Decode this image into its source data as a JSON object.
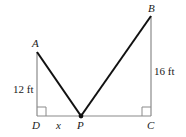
{
  "diagram": {
    "points": {
      "A": {
        "label": "A",
        "x": 37,
        "y": 52
      },
      "B": {
        "label": "B",
        "x": 151,
        "y": 16
      },
      "C": {
        "label": "C",
        "x": 151,
        "y": 116
      },
      "D": {
        "label": "D",
        "x": 37,
        "y": 116
      },
      "P": {
        "label": "P",
        "x": 81,
        "y": 116
      }
    },
    "measurements": {
      "AD": "12 ft",
      "BC": "16 ft",
      "DP": "x"
    },
    "colors": {
      "pole_lines": "#8a8a8a",
      "wire_lines": "#111111",
      "text": "#1a1a1a"
    }
  }
}
